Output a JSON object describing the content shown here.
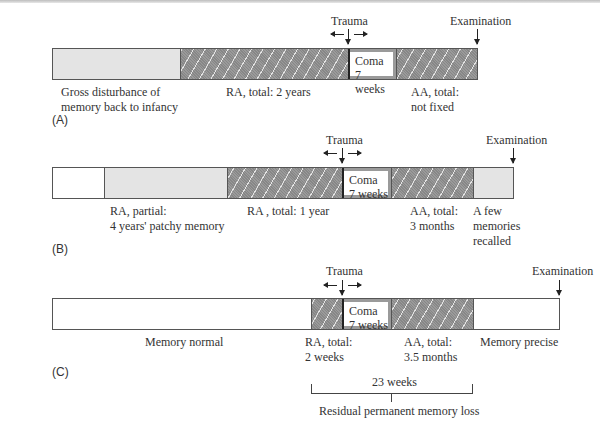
{
  "diagram": {
    "markers": {
      "trauma": "Trauma",
      "examination": "Examination"
    },
    "coma": {
      "line1": "Coma",
      "line2": "7 weeks"
    },
    "panels": [
      {
        "letter": "(A)",
        "segments": [
          {
            "type": "gray",
            "label": [
              "Gross disturbance of",
              "memory back to infancy"
            ]
          },
          {
            "type": "hatch",
            "label": [
              "RA, total: 2 years"
            ]
          },
          {
            "type": "coma"
          },
          {
            "type": "hatch",
            "label": [
              "AA, total:",
              "not fixed"
            ]
          }
        ]
      },
      {
        "letter": "(B)",
        "segments": [
          {
            "type": "white"
          },
          {
            "type": "gray",
            "label": [
              "RA, partial:",
              "4 years' patchy memory"
            ]
          },
          {
            "type": "hatch",
            "label": [
              "RA , total: 1 year"
            ]
          },
          {
            "type": "coma"
          },
          {
            "type": "hatch",
            "label": [
              "AA, total:",
              "3 months"
            ]
          },
          {
            "type": "gray",
            "label": [
              "A few",
              "memories",
              "recalled"
            ]
          }
        ]
      },
      {
        "letter": "(C)",
        "segments": [
          {
            "type": "white",
            "label": [
              "Memory normal"
            ]
          },
          {
            "type": "hatch",
            "label": [
              "RA, total:",
              "2 weeks"
            ]
          },
          {
            "type": "coma"
          },
          {
            "type": "hatch",
            "label": [
              "AA, total:",
              "3.5 months"
            ]
          },
          {
            "type": "white",
            "label": [
              "Memory precise"
            ]
          }
        ]
      }
    ],
    "bracket": {
      "span": "23 weeks",
      "caption": "Residual permanent memory loss"
    }
  }
}
